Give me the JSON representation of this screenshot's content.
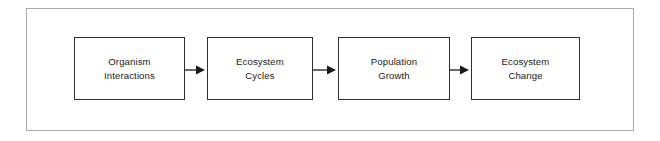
{
  "diagram": {
    "type": "linear-process-flow",
    "title": "",
    "frame": {
      "border_color": "#a9a9a9"
    },
    "style": {
      "box_border_color": "#2e2e2e",
      "box_fill": "#ffffff",
      "text_color": "#1a1a1a",
      "arrow_color": "#1a1a1a",
      "background": "#ffffff"
    },
    "nodes": [
      {
        "id": "node-1",
        "label": "Organism\nInteractions",
        "line1": "Organism",
        "line2": "Interactions"
      },
      {
        "id": "node-2",
        "label": "Ecosystem\nCycles",
        "line1": "Ecosystem",
        "line2": "Cycles"
      },
      {
        "id": "node-3",
        "label": "Population\nGrowth",
        "line1": "Population",
        "line2": "Growth"
      },
      {
        "id": "node-4",
        "label": "Ecosystem\nChange",
        "line1": "Ecosystem",
        "line2": "Change"
      }
    ],
    "connectors": [
      {
        "id": "arrow-1",
        "from": "node-1",
        "to": "node-2",
        "kind": "arrow-right",
        "label": ""
      },
      {
        "id": "arrow-2",
        "from": "node-2",
        "to": "node-3",
        "kind": "arrow-right",
        "label": ""
      },
      {
        "id": "arrow-3",
        "from": "node-3",
        "to": "node-4",
        "kind": "arrow-right",
        "label": ""
      }
    ]
  }
}
